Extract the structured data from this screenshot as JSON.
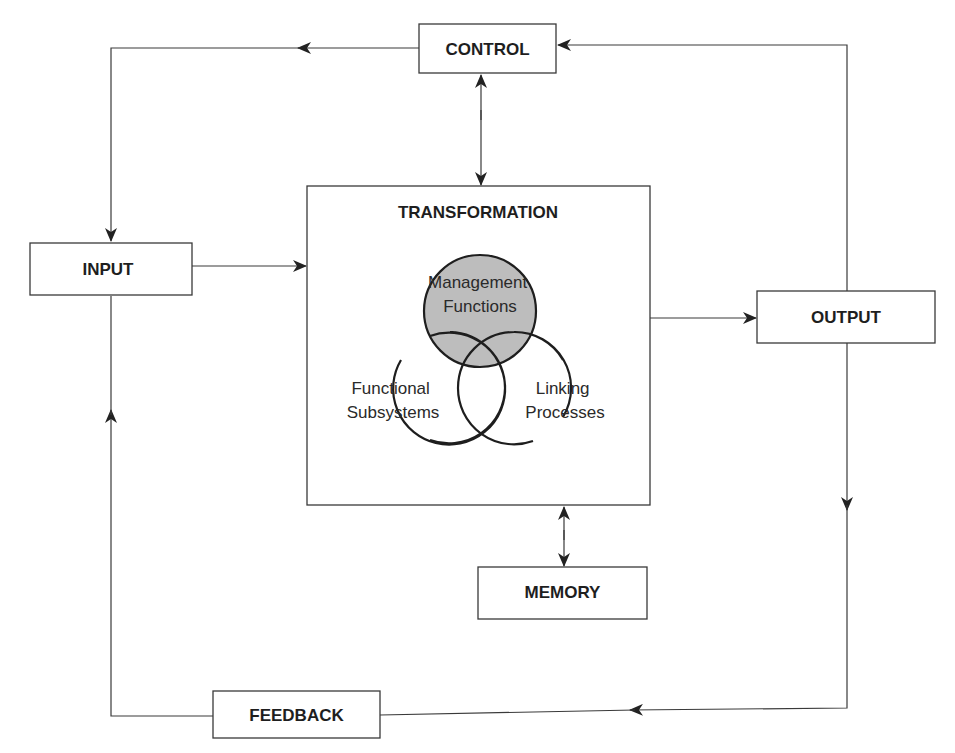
{
  "diagram": {
    "title": "TRANSFORMATION",
    "boxes": {
      "control": {
        "label": "CONTROL",
        "x": 419,
        "y": 24,
        "w": 137,
        "h": 49
      },
      "input": {
        "label": "INPUT",
        "x": 30,
        "y": 243,
        "w": 162,
        "h": 52
      },
      "output": {
        "label": "OUTPUT",
        "x": 757,
        "y": 291,
        "w": 178,
        "h": 52
      },
      "memory": {
        "label": "MEMORY",
        "x": 478,
        "y": 567,
        "w": 169,
        "h": 52
      },
      "feedback": {
        "label": "FEEDBACK",
        "x": 213,
        "y": 691,
        "w": 167,
        "h": 47
      },
      "transformation": {
        "label": "TRANSFORMATION",
        "x": 307,
        "y": 186,
        "w": 343,
        "h": 319
      }
    },
    "venn": {
      "management": {
        "lines": [
          "Management",
          "Functions"
        ],
        "cx": 480,
        "cy": 311,
        "r": 56,
        "fill": "#bdbdbd"
      },
      "functional": {
        "lines": [
          "Functional",
          "Subsystems"
        ],
        "cx": 449,
        "cy": 388,
        "r": 56
      },
      "linking": {
        "lines": [
          "Linking",
          "Processes"
        ],
        "cx": 514,
        "cy": 388,
        "r": 56
      }
    },
    "connections": [
      {
        "from": "output",
        "to": "control",
        "description": "Output feeds Control (arrow into CONTROL)"
      },
      {
        "from": "control",
        "to": "input",
        "description": "Control feeds Input"
      },
      {
        "from": "control",
        "to": "transformation",
        "description": "Bidirectional"
      },
      {
        "from": "input",
        "to": "transformation",
        "description": "Input into Transformation"
      },
      {
        "from": "transformation",
        "to": "output",
        "description": "Transformation to Output"
      },
      {
        "from": "transformation",
        "to": "memory",
        "description": "Bidirectional"
      },
      {
        "from": "output",
        "to": "feedback",
        "description": "Output to Feedback"
      },
      {
        "from": "feedback",
        "to": "input",
        "description": "Feedback to Input"
      }
    ],
    "colors": {
      "line": "#3a3a3a",
      "text": "#1e1e1e",
      "management_fill": "#bdbdbd",
      "background": "#ffffff"
    }
  }
}
